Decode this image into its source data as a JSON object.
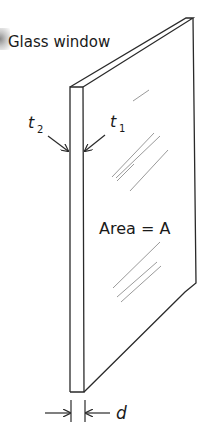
{
  "diagram": {
    "title_label": "Glass window",
    "area_label": "Area = A",
    "surface_labels": {
      "t2": {
        "base": "t",
        "subscript": "2"
      },
      "t1": {
        "base": "t",
        "subscript": "1"
      }
    },
    "thickness_label": "d",
    "colors": {
      "line": "#2a2a2a",
      "glare": "#9a9a9a",
      "text": "#1a1a1a",
      "background": "#ffffff"
    }
  }
}
